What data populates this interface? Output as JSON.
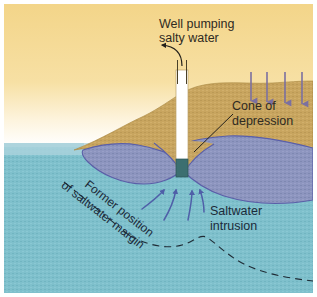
{
  "figure": {
    "type": "cross-section-diagram",
    "width": 317,
    "height": 297
  },
  "labels": {
    "well_title_line1": "Well pumping",
    "well_title_line2": "salty water",
    "cone_line1": "Cone of",
    "cone_line2": "depression",
    "intrusion_line1": "Saltwater",
    "intrusion_line2": "intrusion",
    "former_line1": "Former position",
    "former_line2": "of saltwater margin"
  },
  "colors": {
    "sky_top": "#f5d98d",
    "sky_bottom": "#ffffff",
    "sea_top": "#bcd8e2",
    "sea_body": "#7fc0cc",
    "land": "#c9a martians",
    "land_fill": "#c7a45e",
    "freshwater_lens": "#8b93bd",
    "lens_outline": "#5a5fa8",
    "saltwater": "#79bdc9",
    "well_casing": "#ffffff",
    "well_screen": "#3c6f70",
    "recharge_arrow": "#7b70a0",
    "flow_arrow": "#4f5fa8",
    "dashed_line": "#1f2b35",
    "text": "#2f2a22",
    "border": "#ffffff"
  },
  "elements": {
    "recharge_arrow_count": 4,
    "flow_arrow_count": 4,
    "well_label_arrow": "curved-arrow-up-left",
    "cone_leader_line": "diagonal-leader-line",
    "former_margin_style": "dash-dot-then-dashed"
  }
}
